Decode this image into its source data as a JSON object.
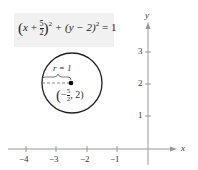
{
  "equation": {
    "text": "(x + 5/2)^2 + (y − 2)^2 = 1",
    "part1_open": "(",
    "part1_var": "x",
    "part1_op": " + ",
    "frac_num": "5",
    "frac_den": "2",
    "part1_close": ")",
    "exp1": "2",
    "part2": " + (y − 2)",
    "exp2": "2",
    "rhs": " = 1"
  },
  "axes": {
    "x_label": "x",
    "y_label": "y",
    "x_ticks": [
      "−4",
      "−3",
      "−2",
      "−1"
    ],
    "y_ticks": [
      "1",
      "2",
      "3"
    ]
  },
  "circle": {
    "radius_label": "r = 1",
    "center_label_open": "(",
    "center_label_num": "5",
    "center_label_den": "2",
    "center_label_rest": ", 2)",
    "center_label_neg": "−",
    "center": [
      -2.5,
      2
    ],
    "radius": 1
  },
  "colors": {
    "axis": "#999999",
    "circle": "#222222",
    "eq_bg": "#f1f1f1"
  }
}
